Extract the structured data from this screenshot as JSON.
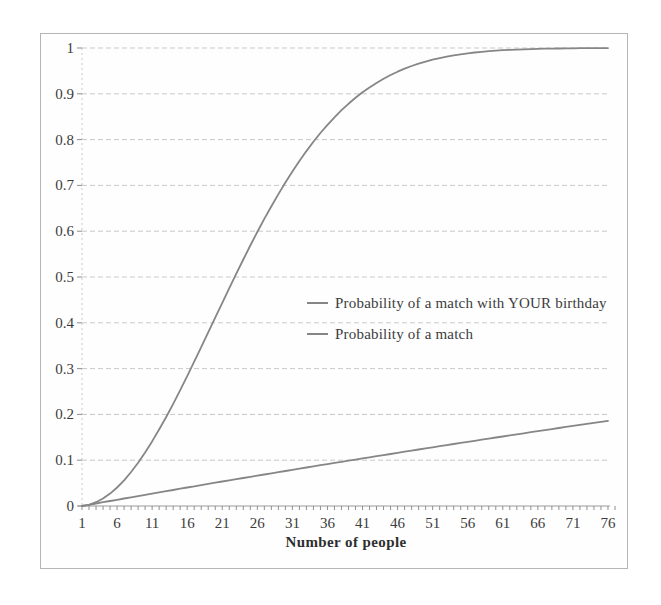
{
  "figure": {
    "background": "#ffffff"
  },
  "colors": {
    "series_line": "#868686",
    "gridline": "#c9c9c9",
    "axis_line": "#9a9a9a",
    "tick_mark": "#8f8f8f",
    "tick_text": "#3c3c3c",
    "frame_border": "#b5b5b5"
  },
  "chart_data": {
    "type": "line",
    "title": "",
    "xlabel": "Number of people",
    "ylabel": "",
    "xlim": [
      1,
      77
    ],
    "ylim": [
      0,
      1
    ],
    "grid": "horizontal dashed gridlines every 0.1",
    "x_tick_labels": [
      "1",
      "6",
      "11",
      "16",
      "21",
      "26",
      "31",
      "36",
      "41",
      "46",
      "51",
      "56",
      "61",
      "66",
      "71",
      "76"
    ],
    "x_tick_values": [
      1,
      6,
      11,
      16,
      21,
      26,
      31,
      36,
      41,
      46,
      51,
      56,
      61,
      66,
      71,
      76
    ],
    "y_tick_labels": [
      "0",
      "0.1",
      "0.2",
      "0.3",
      "0.4",
      "0.5",
      "0.6",
      "0.7",
      "0.8",
      "0.9",
      "1"
    ],
    "y_tick_values": [
      0,
      0.1,
      0.2,
      0.3,
      0.4,
      0.5,
      0.6,
      0.7,
      0.8,
      0.9,
      1
    ],
    "legend": {
      "position": "middle-right",
      "entries": [
        "Probability of a match with YOUR birthday",
        "Probability of a match"
      ]
    },
    "x": [
      1,
      2,
      3,
      4,
      5,
      6,
      7,
      8,
      9,
      10,
      11,
      12,
      13,
      14,
      15,
      16,
      17,
      18,
      19,
      20,
      21,
      22,
      23,
      24,
      25,
      26,
      27,
      28,
      29,
      30,
      31,
      32,
      33,
      34,
      35,
      36,
      37,
      38,
      39,
      40,
      41,
      42,
      43,
      44,
      45,
      46,
      47,
      48,
      49,
      50,
      51,
      52,
      53,
      54,
      55,
      56,
      57,
      58,
      59,
      60,
      61,
      62,
      63,
      64,
      65,
      66,
      67,
      68,
      69,
      70,
      71,
      72,
      73,
      74,
      75,
      76
    ],
    "series": [
      {
        "name": "Probability of a match with YOUR birthday",
        "color": "#868686",
        "values": [
          0.0,
          0.0027,
          0.0055,
          0.0082,
          0.0109,
          0.0136,
          0.0163,
          0.019,
          0.0217,
          0.0244,
          0.0271,
          0.0297,
          0.0324,
          0.035,
          0.0377,
          0.0403,
          0.0429,
          0.0456,
          0.0482,
          0.0508,
          0.0534,
          0.056,
          0.0586,
          0.0611,
          0.0637,
          0.0663,
          0.0688,
          0.0714,
          0.0739,
          0.0764,
          0.079,
          0.0815,
          0.084,
          0.0865,
          0.089,
          0.0915,
          0.094,
          0.0965,
          0.0989,
          0.1014,
          0.1039,
          0.1063,
          0.1088,
          0.1112,
          0.1136,
          0.1161,
          0.1185,
          0.1209,
          0.1233,
          0.1257,
          0.1281,
          0.1305,
          0.1329,
          0.1353,
          0.1377,
          0.14,
          0.1424,
          0.1448,
          0.1471,
          0.1495,
          0.1518,
          0.1541,
          0.1565,
          0.1588,
          0.1611,
          0.1634,
          0.1657,
          0.168,
          0.1703,
          0.1726,
          0.1748,
          0.1771,
          0.1794,
          0.1816,
          0.1839,
          0.1861
        ]
      },
      {
        "name": "Probability of a match",
        "color": "#868686",
        "values": [
          0.0,
          0.0027,
          0.0082,
          0.0164,
          0.0271,
          0.0405,
          0.0562,
          0.0743,
          0.0946,
          0.1169,
          0.1411,
          0.167,
          0.1944,
          0.2231,
          0.2529,
          0.2836,
          0.315,
          0.3469,
          0.3791,
          0.4114,
          0.4437,
          0.4757,
          0.5073,
          0.5383,
          0.5687,
          0.5982,
          0.6269,
          0.6545,
          0.681,
          0.7063,
          0.7305,
          0.7533,
          0.775,
          0.7953,
          0.8144,
          0.8322,
          0.8487,
          0.8641,
          0.8782,
          0.8912,
          0.9032,
          0.914,
          0.9239,
          0.9329,
          0.941,
          0.9483,
          0.9548,
          0.9606,
          0.9658,
          0.9704,
          0.9744,
          0.978,
          0.9811,
          0.9839,
          0.9863,
          0.9883,
          0.9901,
          0.9917,
          0.993,
          0.9941,
          0.9951,
          0.9959,
          0.9966,
          0.9972,
          0.9977,
          0.9981,
          0.9984,
          0.9987,
          0.999,
          0.9992,
          0.9993,
          0.9995,
          0.9996,
          0.9996,
          0.9997,
          0.9998
        ]
      }
    ]
  }
}
